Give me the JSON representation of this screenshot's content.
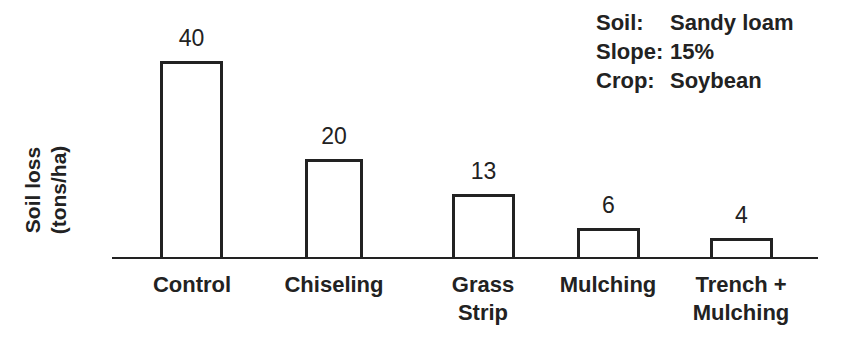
{
  "chart_data": {
    "type": "bar",
    "title": "",
    "xlabel": "",
    "ylabel": "Soil loss (tons/ha)",
    "ylabel_lines": [
      "Soil loss",
      "(tons/ha)"
    ],
    "categories": [
      "Control",
      "Chiseling",
      "Grass Strip",
      "Mulching",
      "Trench + Mulching"
    ],
    "category_lines": [
      [
        "Control"
      ],
      [
        "Chiseling"
      ],
      [
        "Grass",
        "Strip"
      ],
      [
        "Mulching"
      ],
      [
        "Trench +",
        "Mulching"
      ]
    ],
    "values": [
      40,
      20,
      13,
      6,
      4
    ],
    "data_labels": [
      "40",
      "20",
      "13",
      "6",
      "4"
    ],
    "ylim": [
      0,
      45
    ],
    "grid": false,
    "legend": null,
    "annotations": [
      {
        "key": "Soil:",
        "value": "Sandy loam"
      },
      {
        "key": "Slope:",
        "value": "15%"
      },
      {
        "key": "Crop:",
        "value": "Soybean"
      }
    ]
  },
  "colors": {
    "bar_fill": "#ffffff",
    "bar_stroke": "#222222",
    "text": "#222222"
  }
}
